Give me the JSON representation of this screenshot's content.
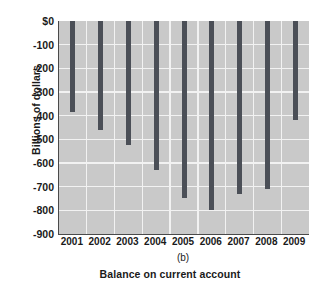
{
  "chart_data": {
    "type": "bar",
    "title": "",
    "subtitle": "",
    "panel_label": "(b)",
    "xlabel": "Balance on current account",
    "ylabel": "Billions of dollars",
    "categories": [
      "2001",
      "2002",
      "2003",
      "2004",
      "2005",
      "2006",
      "2007",
      "2008",
      "2009"
    ],
    "values": [
      -385,
      -460,
      -523,
      -630,
      -748,
      -800,
      -730,
      -710,
      -420
    ],
    "series": [
      {
        "name": "Balance on current account",
        "values": [
          -385,
          -460,
          -523,
          -630,
          -748,
          -800,
          -730,
          -710,
          -420
        ]
      }
    ],
    "ylim": [
      -900,
      0
    ],
    "yticks": [
      0,
      -100,
      -200,
      -300,
      -400,
      -500,
      -600,
      -700,
      -800,
      -900
    ],
    "ytick_labels": [
      "$0",
      "-100",
      "-200",
      "-300",
      "-400",
      "-500",
      "-600",
      "-700",
      "-800",
      "-900"
    ],
    "xtick_labels": [
      "2001",
      "2002",
      "2003",
      "2004",
      "2005",
      "2006",
      "2007",
      "2008",
      "2009"
    ],
    "grid": true,
    "legend": false,
    "legend_position": "none",
    "bar_color": "#4b4f57",
    "plot_background": "#c9c9c9",
    "gridline_color": "#f2f2f2",
    "axis_color": "#4a4a4a",
    "bars_hang_from_zero": true
  }
}
